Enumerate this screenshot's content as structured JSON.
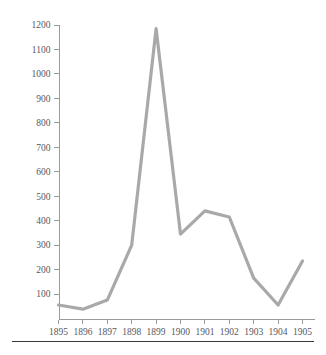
{
  "figure": {
    "clipped_top_caption": "",
    "line_color": "#a9a9a9",
    "axis_color": "#9a9a9a",
    "tick_label_color": "#58585c",
    "background_color": "#ffffff",
    "rule_color": "#3a3a3a"
  },
  "chart_data": {
    "type": "line",
    "title": "",
    "subtitle": "",
    "xlabel": "",
    "ylabel": "",
    "categories": [
      "1895",
      "1896",
      "1897",
      "1898",
      "1899",
      "1900",
      "1901",
      "1902",
      "1903",
      "1904",
      "1905"
    ],
    "x": [
      1895,
      1896,
      1897,
      1898,
      1899,
      1900,
      1901,
      1902,
      1903,
      1904,
      1905
    ],
    "values": [
      55,
      38,
      75,
      300,
      1185,
      345,
      440,
      415,
      165,
      55,
      235
    ],
    "series": [
      {
        "name": "",
        "values": [
          55,
          38,
          75,
          300,
          1185,
          345,
          440,
          415,
          165,
          55,
          235
        ]
      }
    ],
    "xlim": [
      1895,
      1905
    ],
    "ylim": [
      0,
      1200
    ],
    "ytick_values": [
      100,
      200,
      300,
      400,
      500,
      600,
      700,
      800,
      900,
      1000,
      1100,
      1200
    ],
    "ytick_labels": [
      "100",
      "200",
      "300",
      "400",
      "500",
      "600",
      "700",
      "800",
      "900",
      "1000",
      "1100",
      "1200"
    ],
    "xtick_labels": [
      "1895",
      "1896",
      "1897",
      "1898",
      "1899",
      "1900",
      "1901",
      "1902",
      "1903",
      "1904",
      "1905"
    ],
    "grid": false,
    "legend": false,
    "legend_position": "none",
    "markers": false,
    "annotations": []
  }
}
